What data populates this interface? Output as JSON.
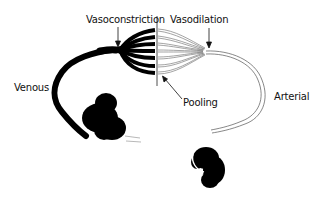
{
  "diagram": {
    "labels": {
      "vasoconstriction": "Vasoconstriction",
      "vasodilation": "Vasodilation",
      "venous": "Venous",
      "arterial": "Arterial",
      "pooling": "Pooling"
    },
    "colors": {
      "venous": "#000000",
      "arterial": "#555555",
      "background": "#ffffff"
    }
  }
}
